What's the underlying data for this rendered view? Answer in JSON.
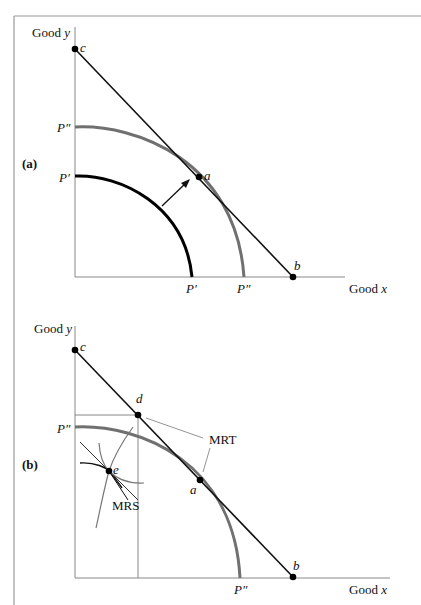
{
  "figure": {
    "panels": [
      {
        "id": "a",
        "label": "(a)",
        "axis_y_label": "Good",
        "axis_y_var": "y",
        "axis_x_label": "Good",
        "axis_x_var": "x",
        "points": {
          "c": "c",
          "a": "a",
          "b": "b"
        },
        "curves": {
          "p_prime_y": "P′",
          "p_prime_x": "P′",
          "p_dprime_y": "P″",
          "p_dprime_x": "P″"
        }
      },
      {
        "id": "b",
        "label": "(b)",
        "axis_y_label": "Good",
        "axis_y_var": "y",
        "axis_x_label": "Good",
        "axis_x_var": "x",
        "points": {
          "c": "c",
          "d": "d",
          "a": "a",
          "b": "b",
          "e": "e"
        },
        "curves": {
          "p_dprime_y": "P″",
          "p_dprime_x": "P″"
        },
        "annotations": {
          "mrt": "MRT",
          "mrs": "MRS"
        }
      }
    ],
    "colors": {
      "axis": "#888888",
      "frame": "#9a9a9a",
      "budget_line": "#111111",
      "ppf_outer": "#707070",
      "ppf_inner": "#000000",
      "indifference": "#777777",
      "leader": "#888888"
    }
  }
}
